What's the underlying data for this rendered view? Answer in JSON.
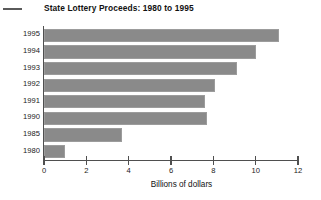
{
  "chart_data": {
    "type": "bar",
    "orientation": "horizontal",
    "title": "State Lottery Proceeds: 1980 to 1995",
    "xlabel": "Billions of dollars",
    "ylabel": "",
    "categories": [
      "1995",
      "1994",
      "1993",
      "1992",
      "1991",
      "1990",
      "1985",
      "1980"
    ],
    "values": [
      11.1,
      10.0,
      9.1,
      8.1,
      7.6,
      7.7,
      3.7,
      1.0
    ],
    "xlim": [
      0,
      12
    ],
    "xticks": [
      "0",
      "2",
      "4",
      "6",
      "8",
      "10",
      "12"
    ],
    "xtick_values": [
      0,
      2,
      4,
      6,
      8,
      10,
      12
    ],
    "grid": false,
    "legend": "none",
    "bar_color": "#8a8a8a",
    "axis_color": "#4f4f4f",
    "background_color": "#ffffff"
  },
  "figure": {
    "title": "State Lottery Proceeds: 1980 to 1995",
    "x_axis_title": "Billions of dollars"
  }
}
